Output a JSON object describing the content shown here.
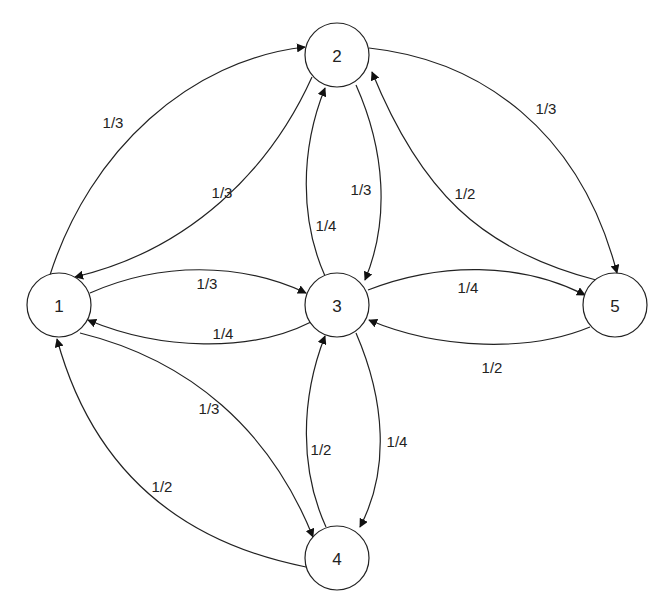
{
  "diagram": {
    "type": "directed-graph",
    "nodes": [
      {
        "id": "1",
        "label": "1"
      },
      {
        "id": "2",
        "label": "2"
      },
      {
        "id": "3",
        "label": "3"
      },
      {
        "id": "4",
        "label": "4"
      },
      {
        "id": "5",
        "label": "5"
      }
    ],
    "edges": [
      {
        "from": "1",
        "to": "2",
        "label": "1/3"
      },
      {
        "from": "2",
        "to": "1",
        "label": "1/3"
      },
      {
        "from": "1",
        "to": "3",
        "label": "1/3"
      },
      {
        "from": "3",
        "to": "1",
        "label": "1/4"
      },
      {
        "from": "1",
        "to": "4",
        "label": "1/3"
      },
      {
        "from": "4",
        "to": "1",
        "label": "1/2"
      },
      {
        "from": "2",
        "to": "3",
        "label": "1/3"
      },
      {
        "from": "3",
        "to": "2",
        "label": "1/4"
      },
      {
        "from": "2",
        "to": "5",
        "label": "1/3"
      },
      {
        "from": "5",
        "to": "2",
        "label": "1/2"
      },
      {
        "from": "3",
        "to": "5",
        "label": "1/4"
      },
      {
        "from": "5",
        "to": "3",
        "label": "1/2"
      },
      {
        "from": "3",
        "to": "4",
        "label": "1/4"
      },
      {
        "from": "4",
        "to": "3",
        "label": "1/2"
      }
    ]
  }
}
